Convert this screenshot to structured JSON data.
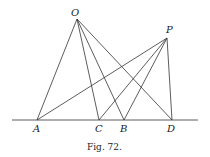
{
  "figure": {
    "caption": "Fig. 72.",
    "points": {
      "O": {
        "label": "O",
        "x": 77,
        "y": 19
      },
      "P": {
        "label": "P",
        "x": 167,
        "y": 38
      },
      "A": {
        "label": "A",
        "x": 37,
        "y": 120
      },
      "C": {
        "label": "C",
        "x": 99,
        "y": 120
      },
      "B": {
        "label": "B",
        "x": 124,
        "y": 120
      },
      "D": {
        "label": "D",
        "x": 172,
        "y": 120
      }
    },
    "baseline": {
      "x1": 12,
      "x2": 198,
      "y": 120
    },
    "segments": [
      [
        "O",
        "A"
      ],
      [
        "O",
        "C"
      ],
      [
        "O",
        "B"
      ],
      [
        "O",
        "D"
      ],
      [
        "P",
        "A"
      ],
      [
        "P",
        "C"
      ],
      [
        "P",
        "B"
      ],
      [
        "P",
        "D"
      ]
    ]
  }
}
